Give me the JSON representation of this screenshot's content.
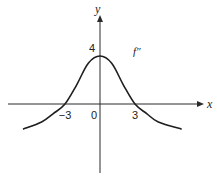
{
  "chart_data": {
    "type": "line",
    "title": "",
    "xlabel": "x",
    "ylabel": "y",
    "xlim": [
      -8,
      9
    ],
    "ylim": [
      -6,
      7.5
    ],
    "grid": false,
    "series": [
      {
        "name": "f''",
        "label": "f″",
        "x": [
          -6.6,
          -5,
          -4,
          -3,
          -2,
          -1,
          0,
          1,
          2,
          3,
          4,
          5,
          7
        ],
        "y": [
          -2.1,
          -1.5,
          -0.8,
          0,
          1.6,
          3.4,
          4,
          3.4,
          1.6,
          0,
          -0.8,
          -1.5,
          -2.1
        ]
      }
    ],
    "x_ticks": [
      {
        "value": -3,
        "label": "−3"
      },
      {
        "value": 0,
        "label": "0"
      },
      {
        "value": 3,
        "label": "3"
      }
    ],
    "y_ticks": [
      {
        "value": 4,
        "label": "4"
      }
    ],
    "annotations": [
      {
        "text": "f″",
        "near": "upper-right of peak"
      }
    ]
  }
}
